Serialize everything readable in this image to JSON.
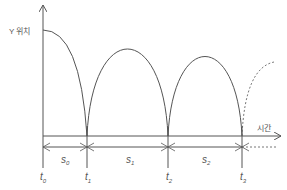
{
  "diagram": {
    "y_axis_label": "Y 위치",
    "x_axis_label": "시간",
    "time_points": [
      {
        "label": "t",
        "sub": "0"
      },
      {
        "label": "t",
        "sub": "1"
      },
      {
        "label": "t",
        "sub": "2"
      },
      {
        "label": "t",
        "sub": "3"
      }
    ],
    "intervals": [
      {
        "label": "s",
        "sub": "0"
      },
      {
        "label": "s",
        "sub": "1"
      },
      {
        "label": "s",
        "sub": "2"
      }
    ],
    "colors": {
      "line": "#555555",
      "dashed": "#777777"
    }
  }
}
